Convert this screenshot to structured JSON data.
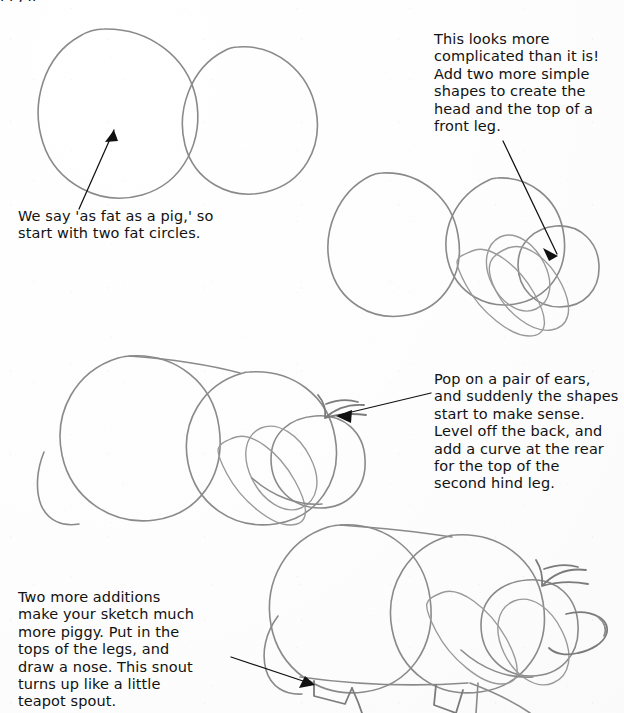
{
  "page": {
    "background_color": "#fefefe",
    "pencil_color": "#8a8a8a",
    "ink_color": "#111111",
    "partial_top_line": "I   I  ,  II"
  },
  "steps": [
    {
      "id": "step-1",
      "number": 1,
      "caption": "We say 'as fat as a pig,' so\nstart with two fat circles.",
      "caption_position": {
        "left": 18,
        "top": 208
      },
      "has_arrow": true,
      "shapes": [
        "big-left-circle",
        "big-right-circle"
      ]
    },
    {
      "id": "step-2",
      "number": 2,
      "caption": "This looks more\ncomplicated than it is!\nAdd two more simple\nshapes to create the\nhead and the top of a\nfront leg.",
      "caption_position": {
        "left": 434,
        "top": 31
      },
      "has_arrow": true,
      "shapes": [
        "body-circle",
        "head-circle",
        "snout-oval",
        "leg-oval",
        "cheek-circle"
      ]
    },
    {
      "id": "step-3",
      "number": 3,
      "caption": "Pop on a pair of ears,\nand suddenly the shapes\nstart to make sense.\nLevel off the back, and\nadd a curve at the rear\nfor the top of the\nsecond hind leg.",
      "caption_position": {
        "left": 434,
        "top": 371
      },
      "has_arrow": true,
      "shapes": [
        "body-circle",
        "head-circle",
        "snout-oval",
        "leg-oval",
        "cheek-circle",
        "ears",
        "level-back",
        "hind-leg-curve"
      ]
    },
    {
      "id": "step-4",
      "number": 4,
      "caption": "Two more additions\nmake your sketch much\nmore piggy. Put in the\ntops of the legs, and\ndraw a nose. This snout\nturns up like a little\nteapot spout.",
      "caption_position": {
        "left": 18,
        "top": 589
      },
      "has_arrow": true,
      "shapes": [
        "body-circle",
        "head-circle",
        "snout-oval",
        "leg-oval",
        "cheek-circle",
        "ears",
        "level-back",
        "hind-leg-curve",
        "front-legs",
        "hind-legs",
        "nose-snout"
      ]
    }
  ],
  "arrows": [
    {
      "name": "arrow-step-1",
      "from": [
        78,
        208
      ],
      "to": [
        113,
        128
      ],
      "points_to": "big-left-circle"
    },
    {
      "name": "arrow-step-2",
      "from": [
        502,
        140
      ],
      "to": [
        555,
        255
      ],
      "points_to": "snout-oval"
    },
    {
      "name": "arrow-step-3",
      "from": [
        430,
        393
      ],
      "to": [
        337,
        415
      ],
      "points_to": "ears"
    },
    {
      "name": "arrow-step-4",
      "from": [
        232,
        658
      ],
      "to": [
        314,
        684
      ],
      "points_to": "front-legs"
    }
  ]
}
